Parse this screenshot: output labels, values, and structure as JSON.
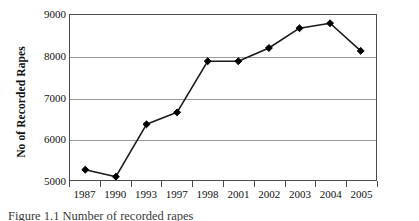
{
  "chart_data": {
    "type": "line",
    "title": "",
    "xlabel": "",
    "ylabel": "No of Recorded Rapes",
    "categories": [
      "1987",
      "1990",
      "1993",
      "1997",
      "1998",
      "2001",
      "2002",
      "2003",
      "2004",
      "2005"
    ],
    "values": [
      5250,
      5080,
      6350,
      6640,
      7880,
      7880,
      8200,
      8680,
      8800,
      8130
    ],
    "series": [
      {
        "name": "No of Recorded Rapes",
        "values": [
          5250,
          5080,
          6350,
          6640,
          7880,
          7880,
          8200,
          8680,
          8800,
          8130
        ]
      }
    ],
    "ylim": [
      5000,
      9000
    ],
    "ytick_values": [
      5000,
      6000,
      7000,
      8000,
      9000
    ],
    "ytick_labels": [
      "5000",
      "6000",
      "7000",
      "8000",
      "9000"
    ],
    "grid": true,
    "grid_axis": "y",
    "legend": false,
    "legend_position": "none",
    "marker": "diamond",
    "line_color": "#1a1a1a",
    "marker_color": "#000000",
    "grid_color": "#9a9a9a",
    "frame_color": "#4a4a4a",
    "background_color": "#ffffff"
  },
  "figure": {
    "caption": "Figure 1.1  Number of recorded rapes"
  }
}
